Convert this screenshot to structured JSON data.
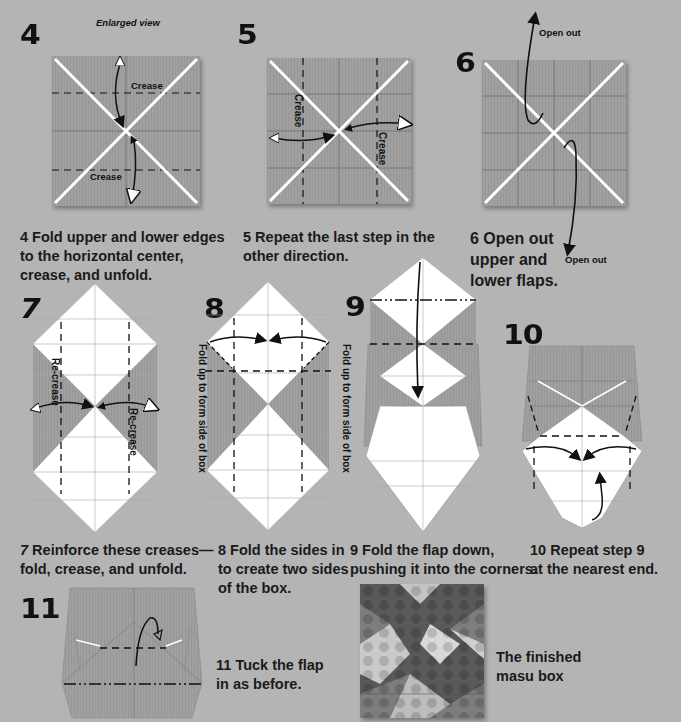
{
  "colors": {
    "background": "#b4b4b4",
    "paper_colored": "#9d9d9d",
    "paper_white": "#ffffff",
    "ink": "#111111"
  },
  "steps": [
    {
      "number": "4",
      "caption": "Fold upper and lower edges to the horizontal center, crease, and unfold.",
      "caption_lines": [
        "Fold upper and lower edges",
        "to the horizontal center,",
        "crease, and unfold."
      ],
      "labels": {
        "enlarged": "Enlarged view",
        "crease_top": "Crease",
        "crease_bottom": "Crease"
      }
    },
    {
      "number": "5",
      "caption": "Repeat the last step in the other direction.",
      "caption_lines": [
        "Repeat the last step in the",
        "other direction."
      ],
      "labels": {
        "crease_left": "Crease",
        "crease_right": "Crease"
      }
    },
    {
      "number": "6",
      "caption": "Open out upper and lower flaps.",
      "caption_lines": [
        "Open out",
        "upper and",
        "lower flaps."
      ],
      "labels": {
        "open_top": "Open out",
        "open_bottom": "Open out"
      }
    },
    {
      "number": "7",
      "caption": "Reinforce these creases—fold, crease, and unfold.",
      "caption_lines": [
        "Reinforce these creases—",
        "fold, crease, and unfold."
      ],
      "labels": {
        "recrease_left": "Re-crease",
        "recrease_right": "Re-crease"
      }
    },
    {
      "number": "8",
      "caption": "Fold the sides in to create two sides of the box.",
      "caption_lines": [
        "Fold the sides in",
        "to create two sides",
        "of the box."
      ],
      "labels": {
        "side_left": "Fold up to form side of box",
        "side_right": "Fold up to form side of box"
      }
    },
    {
      "number": "9",
      "caption": "Fold the flap down, pushing it into the corners.",
      "caption_lines": [
        "Fold the flap down,",
        "pushing it into the corners."
      ]
    },
    {
      "number": "10",
      "caption": "Repeat step 9 at the nearest end.",
      "caption_lines": [
        "Repeat step 9",
        "at the nearest end."
      ]
    },
    {
      "number": "11",
      "caption": "Tuck the flap in as before.",
      "caption_lines": [
        "Tuck the flap",
        "in as before."
      ]
    }
  ],
  "finished": {
    "caption_lines": [
      "The finished",
      "masu box"
    ]
  }
}
